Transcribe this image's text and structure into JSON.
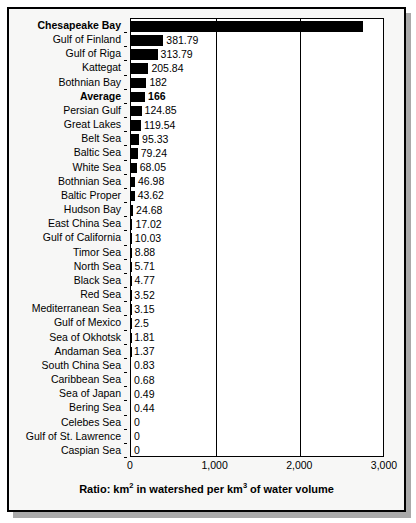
{
  "chart_data": {
    "type": "bar",
    "orientation": "horizontal",
    "title": "",
    "subtitle": "",
    "xlabel": "Ratio: km2 in watershed per km3 of water volume",
    "ylabel": "",
    "xlim": [
      0,
      3000
    ],
    "xticks": [
      0,
      1000,
      2000,
      3000
    ],
    "xtick_labels": [
      "0",
      "1,000",
      "2,000",
      "3,000"
    ],
    "grid": true,
    "legend": null,
    "bar_color": "#000000",
    "categories": [
      "Chesapeake Bay",
      "Gulf of Finland",
      "Gulf of Riga",
      "Kattegat",
      "Bothnian Bay",
      "Average",
      "Persian Gulf",
      "Great Lakes",
      "Belt Sea",
      "Baltic Sea",
      "White Sea",
      "Bothnian Sea",
      "Baltic Proper",
      "Hudson Bay",
      "East China Sea",
      "Gulf of California",
      "Timor Sea",
      "North Sea",
      "Black Sea",
      "Red Sea",
      "Mediterranean Sea",
      "Gulf of Mexico",
      "Sea of Okhotsk",
      "Andaman Sea",
      "South China Sea",
      "Caribbean Sea",
      "Sea of Japan",
      "Bering Sea",
      "Celebes Sea",
      "Gulf of St. Lawrence",
      "Caspian Sea"
    ],
    "values": [
      2742.86,
      381.79,
      313.79,
      205.84,
      182,
      166,
      124.85,
      119.54,
      95.33,
      79.24,
      68.05,
      46.98,
      43.62,
      24.68,
      17.02,
      10.03,
      8.88,
      5.71,
      4.77,
      3.52,
      3.15,
      2.5,
      1.81,
      1.37,
      0.83,
      0.68,
      0.49,
      0.44,
      0,
      0,
      0
    ],
    "value_labels": [
      "2,742.86",
      "381.79",
      "313.79",
      "205.84",
      "182",
      "166",
      "124.85",
      "119.54",
      "95.33",
      "79.24",
      "68.05",
      "46.98",
      "43.62",
      "24.68",
      "17.02",
      "10.03",
      "8.88",
      "5.71",
      "4.77",
      "3.52",
      "3.15",
      "2.5",
      "1.81",
      "1.37",
      "0.83",
      "0.68",
      "0.49",
      "0.44",
      "0",
      "0",
      "0"
    ],
    "emphasized_rows": [
      "Chesapeake Bay",
      "Average"
    ]
  },
  "caption": {
    "prefix": "Ratio: km",
    "sup1": "2",
    "middle": " in watershed per km",
    "sup2": "3",
    "suffix": " of water volume"
  }
}
